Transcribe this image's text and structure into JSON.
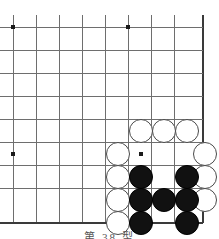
{
  "figure": {
    "type": "go-board-diagram",
    "caption": "第 38 型",
    "caption_clipped": true,
    "background_color": "#ffffff"
  },
  "board": {
    "description": "Go board lower-right corner diagram",
    "line_color": "#6e6e6e",
    "edge_color": "#3a3a3a",
    "line_width": 1,
    "edge_width": 2.4,
    "grid_spacing": 23,
    "origin_x": 13,
    "origin_y": 27,
    "columns": 9,
    "rows": 9,
    "right_edge_x": 203,
    "bottom_edge_y": 223,
    "vertical_lines_x": [
      13,
      36,
      59,
      82,
      105,
      128,
      151,
      174,
      203
    ],
    "horizontal_lines_y": [
      27,
      50,
      73,
      96,
      119,
      142,
      165,
      188,
      223
    ],
    "star_points": [
      {
        "x": 13,
        "y": 27
      },
      {
        "x": 128,
        "y": 27
      },
      {
        "x": 13,
        "y": 154
      },
      {
        "x": 141,
        "y": 154
      }
    ],
    "star_point_size": 4,
    "star_point_color": "#1a1a1a"
  },
  "stones": {
    "radius": 12,
    "white_color": "#ffffff",
    "white_border_color": "#4a4a4a",
    "black_color": "#111111",
    "black_border_color": "#000000",
    "white": [
      {
        "x": 141,
        "y": 131
      },
      {
        "x": 164,
        "y": 131
      },
      {
        "x": 187,
        "y": 131
      },
      {
        "x": 118,
        "y": 154
      },
      {
        "x": 205,
        "y": 154
      },
      {
        "x": 118,
        "y": 177
      },
      {
        "x": 205,
        "y": 177
      },
      {
        "x": 118,
        "y": 200
      },
      {
        "x": 205,
        "y": 200
      },
      {
        "x": 118,
        "y": 223
      }
    ],
    "black": [
      {
        "x": 141,
        "y": 177
      },
      {
        "x": 187,
        "y": 177
      },
      {
        "x": 141,
        "y": 200
      },
      {
        "x": 164,
        "y": 200
      },
      {
        "x": 187,
        "y": 200
      },
      {
        "x": 141,
        "y": 223
      },
      {
        "x": 187,
        "y": 223
      }
    ]
  },
  "caption_position": {
    "top": 228
  }
}
